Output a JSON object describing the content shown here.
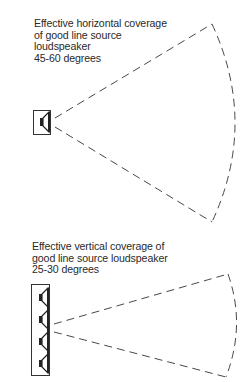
{
  "diagrams": {
    "horizontal": {
      "caption_lines": [
        "Effective horizontal coverage",
        "of good line source",
        "loudspeaker",
        "45-60 degrees"
      ],
      "coverage_degrees": "45-60",
      "speaker_count": 1
    },
    "vertical": {
      "caption_lines": [
        "Effective vertical coverage of",
        "good line source loudspeaker",
        "25-30 degrees"
      ],
      "coverage_degrees": "25-30",
      "speaker_count": 4
    }
  },
  "colors": {
    "line": "#333333",
    "background": "#ffffff"
  }
}
